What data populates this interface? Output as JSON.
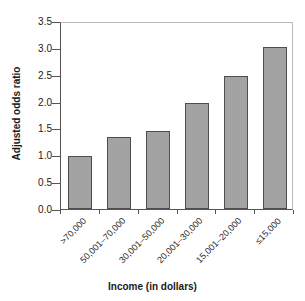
{
  "chart_data": {
    "type": "bar",
    "title": "",
    "subtitle": "",
    "xlabel": "Income (in dollars)",
    "ylabel": "Adjusted odds ratio",
    "categories": [
      ">70,000",
      "50,001–70,000",
      "30,001–50,000",
      "20,001–30,000",
      "15,001–20,000",
      "≤15,000"
    ],
    "values": [
      1.0,
      1.35,
      1.47,
      2.0,
      2.51,
      3.05
    ],
    "ylim": [
      0.0,
      3.5
    ],
    "ytick_labels": [
      "0.0",
      "0.5",
      "1.0",
      "1.5",
      "2.0",
      "2.5",
      "3.0",
      "3.5"
    ],
    "ytick_values": [
      0.0,
      0.5,
      1.0,
      1.5,
      2.0,
      2.5,
      3.0,
      3.5
    ],
    "grid": false,
    "legend": "none",
    "bar_color": "#a3a3a3",
    "bar_border_color": "#4d4d4d",
    "axis_color": "#555555",
    "frame_color": "#bcbcbc",
    "text_color": "#1a1a1a"
  }
}
